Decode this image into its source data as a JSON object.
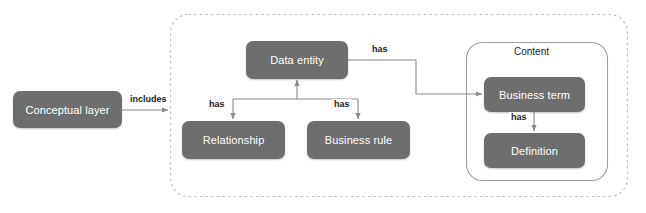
{
  "diagram": {
    "colors": {
      "node_fill": "#6e6e6e",
      "node_text": "#ffffff",
      "line": "#8a8a8a",
      "dashed_border": "#b9b9b9",
      "group_border": "#9a9a9a",
      "background": "#ffffff"
    },
    "nodes": [
      {
        "id": "conceptual_layer",
        "label": "Conceptual layer"
      },
      {
        "id": "data_entity",
        "label": "Data entity"
      },
      {
        "id": "relationship",
        "label": "Relationship"
      },
      {
        "id": "business_rule",
        "label": "Business rule"
      },
      {
        "id": "business_term",
        "label": "Business term"
      },
      {
        "id": "definition",
        "label": "Definition"
      }
    ],
    "groups": [
      {
        "id": "conceptual_layer_group",
        "label": "",
        "style": "dashed"
      },
      {
        "id": "content_group",
        "label": "Content",
        "style": "solid"
      }
    ],
    "edges": [
      {
        "id": "includes",
        "from": "conceptual_layer",
        "to": "conceptual_layer_group",
        "label": "includes"
      },
      {
        "id": "has_relationship",
        "from": "data_entity",
        "to": "relationship",
        "label": "has"
      },
      {
        "id": "has_business_rule",
        "from": "data_entity",
        "to": "business_rule",
        "label": "has"
      },
      {
        "id": "has_business_term",
        "from": "data_entity",
        "to": "business_term",
        "label": "has"
      },
      {
        "id": "has_definition",
        "from": "business_term",
        "to": "definition",
        "label": "has"
      }
    ]
  }
}
